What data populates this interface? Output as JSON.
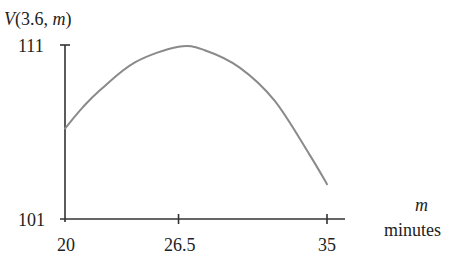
{
  "chart_data": {
    "type": "line",
    "title": "V(3.6, m)",
    "title_parts": {
      "func": "V",
      "open": "(3.6, ",
      "var": "m",
      "close": ")"
    },
    "xlabel": "m",
    "xlabel_units": "minutes",
    "ylabel": "V(3.6, m)",
    "x_ticks": [
      20,
      26.5,
      35
    ],
    "x_tick_labels": [
      "20",
      "26.5",
      "35"
    ],
    "y_ticks": [
      101,
      111
    ],
    "y_tick_labels": [
      "101",
      "111"
    ],
    "xlim": [
      20,
      36
    ],
    "ylim": [
      101,
      111
    ],
    "grid": false,
    "legend": null,
    "series": [
      {
        "name": "V(3.6, m)",
        "x": [
          20,
          21,
          22,
          24,
          26.5,
          28,
          30,
          32,
          34,
          35
        ],
        "y": [
          106.2,
          107.4,
          108.4,
          110.0,
          110.9,
          110.7,
          109.7,
          107.8,
          104.7,
          103.0
        ]
      }
    ],
    "line_color": "#8a8a8a",
    "axis_color": "#333333"
  }
}
